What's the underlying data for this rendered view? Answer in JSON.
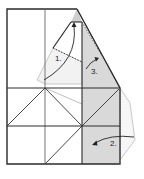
{
  "diagram": {
    "type": "origami-folding-instructions",
    "colors": {
      "line": "#2a2a2a",
      "thin_line": "#555555",
      "shade": "#d9d9d9",
      "ghost": "#b8b8b8",
      "ghost_fill": "#f2f2f2"
    },
    "steps": [
      {
        "label": "1.",
        "description": "fold flap up along arrow"
      },
      {
        "label": "2.",
        "description": "fold right flap inward"
      },
      {
        "label": "3.",
        "description": "tuck flap under"
      }
    ]
  }
}
